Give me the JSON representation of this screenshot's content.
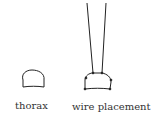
{
  "figures": [
    {
      "id": "thorax",
      "label": "thorax"
    },
    {
      "id": "wire",
      "label": "wire placement"
    }
  ],
  "colors": {
    "stroke": "#222222",
    "text": "#333333"
  }
}
